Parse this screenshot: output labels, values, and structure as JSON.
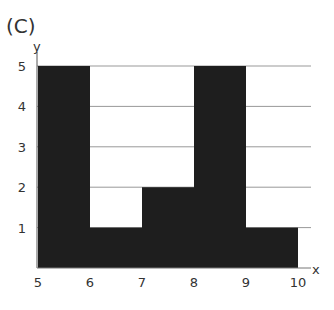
{
  "panel_label": "(C)",
  "chart_data": {
    "type": "bar",
    "title": "",
    "panel_label": "(C)",
    "xlabel": "x",
    "ylabel": "y",
    "bins": [
      [
        5,
        6
      ],
      [
        6,
        7
      ],
      [
        7,
        8
      ],
      [
        8,
        9
      ],
      [
        9,
        10
      ]
    ],
    "categories": [
      "5-6",
      "6-7",
      "7-8",
      "8-9",
      "9-10"
    ],
    "values": [
      5,
      1,
      2,
      5,
      1
    ],
    "x_ticks": [
      "5",
      "6",
      "7",
      "8",
      "9",
      "10"
    ],
    "y_ticks": [
      "1",
      "2",
      "3",
      "4",
      "5"
    ],
    "xlim": [
      5,
      10
    ],
    "ylim": [
      0,
      5
    ],
    "grid": "horizontal",
    "bar_color": "#1e1e1e",
    "grid_color": "#999999"
  },
  "axes": {
    "x_label": "x",
    "y_label": "y"
  }
}
